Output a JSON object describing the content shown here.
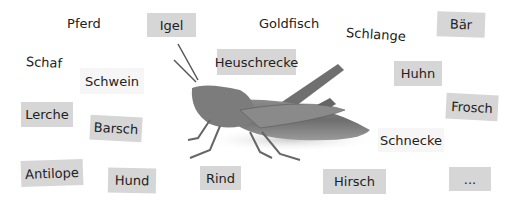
{
  "labels": [
    {
      "id": "pferd",
      "text": "Pferd"
    },
    {
      "id": "igel",
      "text": "Igel"
    },
    {
      "id": "goldfisch",
      "text": "Goldfisch"
    },
    {
      "id": "schlange",
      "text": "Schlange"
    },
    {
      "id": "baer",
      "text": "Bär"
    },
    {
      "id": "schaf",
      "text": "Schaf"
    },
    {
      "id": "heuschrecke",
      "text": "Heuschrecke"
    },
    {
      "id": "schwein",
      "text": "Schwein"
    },
    {
      "id": "huhn",
      "text": "Huhn"
    },
    {
      "id": "lerche",
      "text": "Lerche"
    },
    {
      "id": "barsch",
      "text": "Barsch"
    },
    {
      "id": "frosch",
      "text": "Frosch"
    },
    {
      "id": "schnecke",
      "text": "Schnecke"
    },
    {
      "id": "antilope",
      "text": "Antilope"
    },
    {
      "id": "hund",
      "text": "Hund"
    },
    {
      "id": "rind",
      "text": "Rind"
    },
    {
      "id": "hirsch",
      "text": "Hirsch"
    },
    {
      "id": "more",
      "text": "..."
    }
  ],
  "image": {
    "subject": "grasshopper-illustration"
  },
  "colors": {
    "label_gray": "#d6d6d6",
    "label_light": "#f6f6f6",
    "text": "#222222"
  }
}
